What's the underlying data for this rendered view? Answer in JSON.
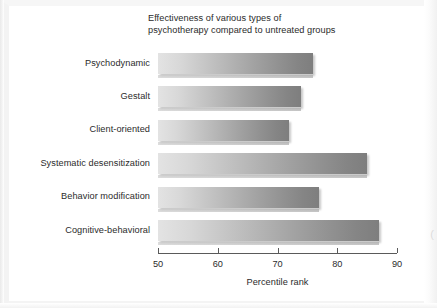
{
  "figure": {
    "title_line1": "Effectiveness of various types of",
    "title_line2": "psychotherapy compared to untreated groups",
    "axis_title": "Percentile rank",
    "edge_glyph": "("
  },
  "chart_data": {
    "type": "bar",
    "orientation": "horizontal",
    "xlabel": "Percentile rank",
    "ylabel": "",
    "xlim": [
      50,
      90
    ],
    "xticks": [
      50,
      60,
      70,
      80,
      90
    ],
    "xtick_labels": [
      "50",
      "60",
      "70",
      "80",
      "90"
    ],
    "grid": false,
    "legend": null,
    "categories": [
      "Psychodynamic",
      "Gestalt",
      "Client-oriented",
      "Systematic desensitization",
      "Behavior modification",
      "Cognitive-behavioral"
    ],
    "values": [
      76,
      74,
      72,
      85,
      77,
      87
    ],
    "bar_colors": {
      "gradient_start": "#e3e3e3",
      "gradient_end": "#7e7e7e"
    },
    "axis_color": "#5a5a5a",
    "text_color": "#2b2b2b",
    "background": "#ffffff"
  }
}
